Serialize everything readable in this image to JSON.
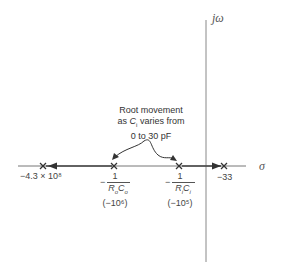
{
  "axes": {
    "real_label": "σ",
    "imag_label": "jω"
  },
  "annotation": {
    "line1": "Root movement",
    "line2_prefix": "as ",
    "line2_var": "C",
    "line2_sub": "i",
    "line2_suffix": " varies from",
    "line3": "0 to 30 pF"
  },
  "poles": [
    {
      "id": "p1",
      "label": "−4.3 × 10⁸"
    },
    {
      "id": "p2",
      "neg": "−",
      "num": "1",
      "den_R": "R",
      "den_Rsub": "o",
      "den_C": "C",
      "den_Csub": "o",
      "value": "(−10⁶)"
    },
    {
      "id": "p3",
      "neg": "−",
      "num": "1",
      "den_R": "R",
      "den_Rsub": "i",
      "den_C": "C",
      "den_Csub": "i",
      "value": "(−10⁵)"
    },
    {
      "id": "p4",
      "label": "−33"
    }
  ],
  "colors": {
    "axis": "#777777",
    "marker": "#333333",
    "text": "#333333"
  }
}
